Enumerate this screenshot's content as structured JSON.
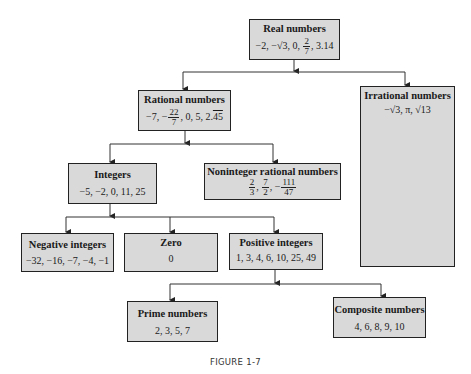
{
  "figure": {
    "caption": "FIGURE 1-7",
    "box_fill": "#d9d9d9",
    "border_color": "#222222"
  },
  "nodes": {
    "real": {
      "title": "Real numbers",
      "examples": [
        "−2",
        "−√3",
        "0",
        "2/7",
        "3.14"
      ],
      "v1": "−2, −√3, 0,",
      "frac_num": "2",
      "frac_den": "7",
      "v2": ", 3.14"
    },
    "rational": {
      "title": "Rational numbers",
      "examples": [
        "−7",
        "−22/7",
        "0",
        "5",
        "2.45 (repeating)"
      ],
      "v1": "−7, −",
      "frac_num": "22",
      "frac_den": "7",
      "v2": ", 0, 5, 2.",
      "repeat": "45"
    },
    "irrational": {
      "title": "Irrational numbers",
      "examples": [
        "−√3",
        "π",
        "√13"
      ],
      "values": "−√3, π, √13"
    },
    "integers": {
      "title": "Integers",
      "examples": [
        "−5",
        "−2",
        "0",
        "11",
        "25"
      ],
      "values": "−5, −2, 0, 11, 25"
    },
    "noninteger": {
      "title": "Noninteger rational numbers",
      "examples": [
        "2/3",
        "7/2",
        "−111/47"
      ],
      "f1_num": "2",
      "f1_den": "3",
      "sep1": ",",
      "f2_num": "7",
      "f2_den": "2",
      "sep2": ", −",
      "f3_num": "111",
      "f3_den": "47"
    },
    "negative": {
      "title": "Negative integers",
      "examples": [
        "−32",
        "−16",
        "−7",
        "−4",
        "−1"
      ],
      "values": "−32, −16, −7, −4, −1"
    },
    "zero": {
      "title": "Zero",
      "examples": [
        "0"
      ],
      "values": "0"
    },
    "positive": {
      "title": "Positive integers",
      "examples": [
        "1",
        "3",
        "4",
        "6",
        "10",
        "25",
        "49"
      ],
      "values": "1, 3, 4, 6, 10, 25, 49"
    },
    "prime": {
      "title": "Prime numbers",
      "examples": [
        "2",
        "3",
        "5",
        "7"
      ],
      "values": "2, 3, 5, 7"
    },
    "composite": {
      "title": "Composite numbers",
      "examples": [
        "4",
        "6",
        "8",
        "9",
        "10"
      ],
      "values": "4, 6, 8, 9, 10"
    }
  },
  "edges": [
    [
      "real",
      "rational"
    ],
    [
      "real",
      "irrational"
    ],
    [
      "rational",
      "integers"
    ],
    [
      "rational",
      "noninteger"
    ],
    [
      "integers",
      "negative"
    ],
    [
      "integers",
      "zero"
    ],
    [
      "integers",
      "positive"
    ],
    [
      "positive",
      "prime"
    ],
    [
      "positive",
      "composite"
    ]
  ]
}
